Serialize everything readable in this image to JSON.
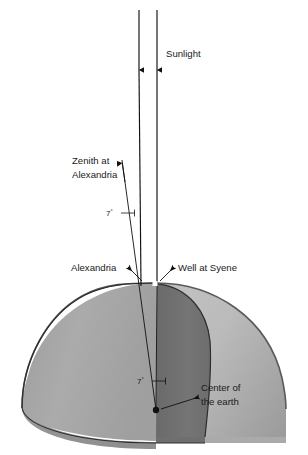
{
  "figure": {
    "background_color": "#ffffff"
  },
  "labels": {
    "sunlight": "Sunlight",
    "zenith_line1": "Zenith at",
    "zenith_line2": "Alexandria",
    "angle_top_value": "7",
    "angle_top_unit": "°",
    "angle_bottom_value": "7",
    "angle_bottom_unit": "°",
    "alexandria": "Alexandria",
    "well_at_syene": "Well at Syene",
    "center_line1": "Center of",
    "center_line2": "the earth"
  },
  "colors": {
    "globe_left_face": "#a9a9a9",
    "globe_right_face": "#b6b6b6",
    "globe_wedge": "#707070",
    "globe_base_shadow": "#9b9b9b",
    "globe_edge": "#5a5a5a",
    "globe_edge_dark": "#2f2f2f",
    "line": "#111111",
    "text": "#1a1a1a"
  },
  "geometry": {
    "sun_ray_left_x": 139,
    "sun_ray_right_x": 157,
    "sun_ray_top_y": 10,
    "arrowhead_y": 74,
    "globe_center_x": 156,
    "globe_center_y": 410,
    "globe_top_y": 283,
    "globe_left_x": 22,
    "globe_right_x": 286,
    "globe_bottom_y": 448,
    "angle_degrees": 7
  }
}
